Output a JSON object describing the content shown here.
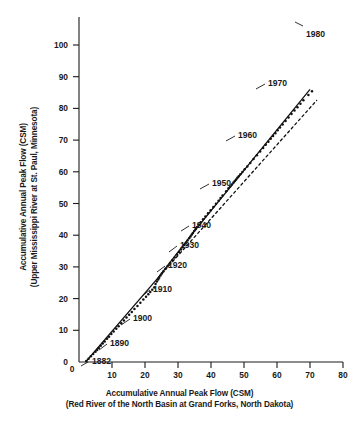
{
  "chart_data": {
    "type": "scatter",
    "title": "",
    "xlabel": "Accumulative Annual Peak Flow (CSM)",
    "xlabel_sub": "(Red River of the North Basin at Grand Forks, North Dakota)",
    "ylabel": "Accumulative Annual Peak Flow (CSM)",
    "ylabel_sub": "(Upper Mississippi River at St. Paul, Minnesota)",
    "xlim": [
      0,
      80
    ],
    "ylim": [
      0,
      107
    ],
    "xticks": [
      0,
      10,
      20,
      30,
      40,
      50,
      60,
      70,
      80
    ],
    "yticks": [
      0,
      10,
      20,
      30,
      40,
      50,
      60,
      70,
      80,
      90,
      100
    ],
    "grid": false,
    "legend": "none",
    "point_color": "#111111",
    "line_color": "#111111",
    "dashed_color": "#111111",
    "series": [
      {
        "name": "Double mass curve points",
        "marker": "dot",
        "x": [
          2.2,
          2.9,
          3.6,
          4.3,
          5.0,
          5.5,
          6.0,
          6.6,
          7.2,
          7.8,
          8.5,
          9.1,
          9.8,
          10.5,
          11.3,
          12.0,
          12.8,
          13.6,
          14.4,
          15.2,
          16.0,
          16.8,
          17.7,
          18.6,
          19.5,
          20.3,
          21.0,
          21.6,
          22.2,
          22.8,
          23.2,
          23.6,
          24.0,
          24.3,
          24.7,
          25.1,
          25.6,
          26.2,
          26.9,
          27.6,
          28.3,
          29.0,
          29.7,
          30.3,
          30.9,
          31.4,
          31.9,
          32.4,
          32.9,
          33.4,
          33.8,
          34.2,
          34.5,
          34.9,
          35.3,
          35.8,
          36.3,
          36.9,
          37.6,
          38.3,
          39.1,
          39.9,
          40.7,
          41.5,
          42.3,
          42.9,
          43.5,
          44.6,
          45.3,
          45.8,
          46.3,
          46.8,
          47.2,
          47.6,
          48.0,
          48.4,
          48.9,
          49.5,
          50.2,
          51.0,
          51.9,
          52.9,
          53.9,
          54.9,
          55.8,
          56.6,
          57.4,
          58.1,
          58.8,
          59.5,
          60.2,
          60.9,
          61.7,
          62.6,
          63.5,
          64.4,
          65.3,
          66.2,
          67.1,
          68.0,
          69.5,
          70.6
        ],
        "y": [
          0.3,
          1.0,
          1.8,
          2.5,
          3.2,
          3.8,
          4.4,
          5.1,
          5.8,
          6.5,
          7.3,
          8.0,
          8.8,
          9.6,
          10.5,
          11.3,
          12.2,
          13.1,
          14.0,
          14.9,
          15.8,
          16.7,
          17.7,
          18.7,
          19.7,
          20.6,
          21.4,
          22.1,
          22.8,
          23.5,
          24.6,
          25.4,
          26.0,
          26.6,
          27.3,
          27.9,
          28.6,
          29.4,
          30.3,
          31.2,
          32.1,
          33.0,
          33.9,
          34.7,
          35.5,
          36.2,
          36.9,
          37.6,
          38.3,
          39.0,
          39.6,
          40.2,
          40.7,
          41.3,
          41.9,
          42.6,
          43.3,
          44.1,
          45.0,
          45.9,
          46.9,
          47.9,
          48.9,
          49.9,
          50.9,
          51.7,
          52.5,
          53.9,
          54.8,
          55.4,
          56.0,
          56.6,
          57.1,
          57.6,
          58.1,
          58.6,
          59.2,
          59.9,
          60.8,
          61.7,
          62.8,
          64.0,
          65.2,
          66.4,
          67.5,
          68.5,
          69.5,
          70.4,
          71.3,
          72.2,
          73.1,
          74.0,
          74.9,
          76.0,
          77.1,
          78.2,
          79.3,
          80.4,
          81.5,
          82.6,
          84.2,
          85.4
        ]
      }
    ],
    "fitted_line": {
      "name": "Double mass line of best fit",
      "style": "solid",
      "points": [
        [
          2.0,
          0.0
        ],
        [
          24.0,
          26.6
        ],
        [
          34.5,
          40.7
        ],
        [
          70.0,
          86.0
        ]
      ]
    },
    "reference_line": {
      "name": "Extended early-period trend (dashed)",
      "style": "dashed",
      "points": [
        [
          24.0,
          26.6
        ],
        [
          72.0,
          82.5
        ]
      ]
    },
    "annotations": [
      {
        "label": "1882",
        "x": 2.4,
        "y": 0.5,
        "label_x": 92,
        "label_y": 356,
        "leader": [
          [
            88,
            362
          ],
          [
            81,
            366
          ]
        ]
      },
      {
        "label": "1890",
        "x": 6.0,
        "y": 4.4,
        "label_x": 110,
        "label_y": 338,
        "leader": [
          [
            107,
            344
          ],
          [
            99,
            350
          ]
        ]
      },
      {
        "label": "1900",
        "x": 12.5,
        "y": 11.9,
        "label_x": 133,
        "label_y": 313,
        "leader": [
          [
            130,
            319
          ],
          [
            121,
            325
          ]
        ]
      },
      {
        "label": "1910",
        "x": 21.5,
        "y": 22.0,
        "label_x": 153,
        "label_y": 284,
        "leader": [
          [
            150,
            290
          ],
          [
            142,
            296
          ]
        ]
      },
      {
        "label": "1920",
        "x": 26.5,
        "y": 28.9,
        "label_x": 168,
        "label_y": 260,
        "leader": [
          [
            165,
            266
          ],
          [
            157,
            272
          ]
        ]
      },
      {
        "label": "1930",
        "x": 32.0,
        "y": 37.5,
        "label_x": 180,
        "label_y": 240,
        "leader": [
          [
            177,
            246
          ],
          [
            169,
            252
          ]
        ]
      },
      {
        "label": "1940",
        "x": 36.0,
        "y": 43.0,
        "label_x": 192,
        "label_y": 220,
        "leader": [
          [
            189,
            226
          ],
          [
            181,
            231
          ]
        ]
      },
      {
        "label": "1950",
        "x": 44.0,
        "y": 53.2,
        "label_x": 212,
        "label_y": 178,
        "leader": [
          [
            209,
            184
          ],
          [
            200,
            189
          ]
        ]
      },
      {
        "label": "1960",
        "x": 52.0,
        "y": 63.0,
        "label_x": 238,
        "label_y": 130,
        "leader": [
          [
            235,
            136
          ],
          [
            226,
            141
          ]
        ]
      },
      {
        "label": "1970",
        "x": 60.0,
        "y": 72.8,
        "label_x": 268,
        "label_y": 78,
        "leader": [
          [
            265,
            84
          ],
          [
            256,
            89
          ]
        ]
      },
      {
        "label": "1980",
        "x": 70.0,
        "y": 85.0,
        "label_x": 306,
        "label_y": 29,
        "leader": [
          [
            303,
            26
          ],
          [
            295,
            22
          ]
        ]
      }
    ]
  }
}
